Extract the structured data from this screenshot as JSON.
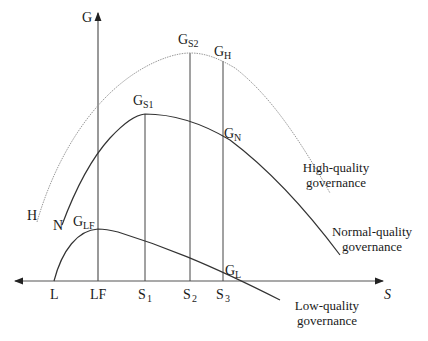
{
  "diagram": {
    "type": "economic curve diagram",
    "axes": {
      "y_label": "G",
      "x_label": "S"
    },
    "x_ticks": [
      {
        "id": "L",
        "label": "L",
        "sub": ""
      },
      {
        "id": "LF",
        "label": "LF",
        "sub": ""
      },
      {
        "id": "S1",
        "label": "S",
        "sub": "1"
      },
      {
        "id": "S2",
        "label": "S",
        "sub": "2"
      },
      {
        "id": "S3",
        "label": "S",
        "sub": "3"
      }
    ],
    "point_labels": {
      "gs2": {
        "main": "G",
        "sub": "S2"
      },
      "gh": {
        "main": "G",
        "sub": "H"
      },
      "gs1": {
        "main": "G",
        "sub": "S1"
      },
      "gn": {
        "main": "G",
        "sub": "N"
      },
      "glf": {
        "main": "G",
        "sub": "LF"
      },
      "gl": {
        "main": "G",
        "sub": "L"
      }
    },
    "curve_start_labels": {
      "high": "H",
      "normal": "N"
    },
    "curves": [
      {
        "id": "high",
        "name_line1": "High-quality",
        "name_line2": "governance",
        "style": "dotted",
        "color": "#9a9a9a"
      },
      {
        "id": "normal",
        "name_line1": "Normal-quality",
        "name_line2": "governance",
        "style": "solid",
        "color": "#333333"
      },
      {
        "id": "low",
        "name_line1": "Low-quality",
        "name_line2": "governance",
        "style": "solid",
        "color": "#333333"
      }
    ]
  }
}
